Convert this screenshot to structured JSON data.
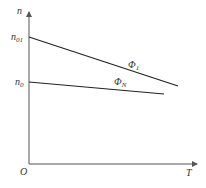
{
  "diagram": {
    "type": "mechanical characteristic curves",
    "axes": {
      "y_label": "n",
      "x_label": "T",
      "origin_label": "O"
    },
    "y_ticks": [
      {
        "base": "n",
        "sub": "01"
      },
      {
        "base": "n",
        "sub": "0"
      }
    ],
    "curves": [
      {
        "name": "Φ_1",
        "base": "Φ",
        "sub": "1",
        "start_level": "n01",
        "note": "steeper descending line"
      },
      {
        "name": "Φ_N",
        "base": "Φ",
        "sub": "N",
        "start_level": "n0",
        "note": "flatter descending line"
      }
    ]
  }
}
